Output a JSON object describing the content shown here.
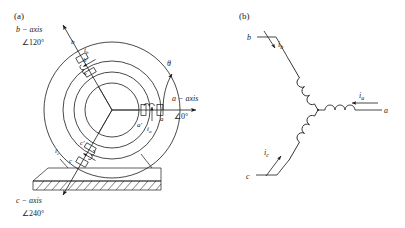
{
  "figure": {
    "panel_a": {
      "label": "(a)",
      "description": "cross-section of three-phase machine showing a, b, c magnetic axes",
      "axes": [
        {
          "name": "a-axis",
          "label": "a − axis",
          "angle_label": "∠0°",
          "angle_deg": 0
        },
        {
          "name": "b-axis",
          "label": "b − axis",
          "angle_label": "∠120°",
          "angle_deg": 120
        },
        {
          "name": "c-axis",
          "label": "c − axis",
          "angle_label": "∠240°",
          "angle_deg": 240
        }
      ],
      "rotor_angle_symbol": "θ",
      "conductors": [
        {
          "name": "a",
          "label": "a"
        },
        {
          "name": "a-prime",
          "label": "a′"
        },
        {
          "name": "b",
          "label": "b"
        },
        {
          "name": "b-prime",
          "label": "b′"
        },
        {
          "name": "c",
          "label": "c"
        },
        {
          "name": "c-prime",
          "label": "c′"
        }
      ],
      "currents": [
        {
          "name": "ia",
          "label": "i",
          "sub": "a"
        },
        {
          "name": "ib",
          "label": "i",
          "sub": "b"
        },
        {
          "name": "ic",
          "label": "i",
          "sub": "c"
        }
      ]
    },
    "panel_b": {
      "label": "(b)",
      "description": "wye-connected three-phase winding schematic",
      "terminals": [
        {
          "name": "a",
          "label": "a"
        },
        {
          "name": "b",
          "label": "b"
        },
        {
          "name": "c",
          "label": "c"
        }
      ],
      "currents": [
        {
          "name": "ia",
          "label": "i",
          "sub": "a"
        },
        {
          "name": "ib",
          "label": "i",
          "sub": "b"
        },
        {
          "name": "ic",
          "label": "i",
          "sub": "c"
        }
      ]
    },
    "colors": {
      "line": "#1a1a1a",
      "background": "#ffffff"
    }
  }
}
